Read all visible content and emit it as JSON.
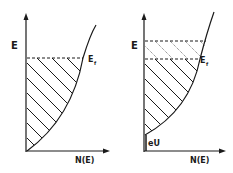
{
  "diagram": {
    "panels": [
      {
        "id": "left",
        "y_axis_label": "E",
        "x_axis_label": "N(E)",
        "fermi_label": "E",
        "fermi_subscript": "f",
        "shading": "filled states below Fermi level (diagonal hatching)"
      },
      {
        "id": "right",
        "y_axis_label": "E",
        "x_axis_label": "N(E)",
        "fermi_label": "E",
        "fermi_subscript": "f",
        "shift_label": "eU",
        "shading": "filled states below Fermi level (solid hatching) plus shifted band region (dotted hatching)"
      }
    ],
    "colors": {
      "ink": "#1a1a1a",
      "background": "#ffffff"
    }
  }
}
